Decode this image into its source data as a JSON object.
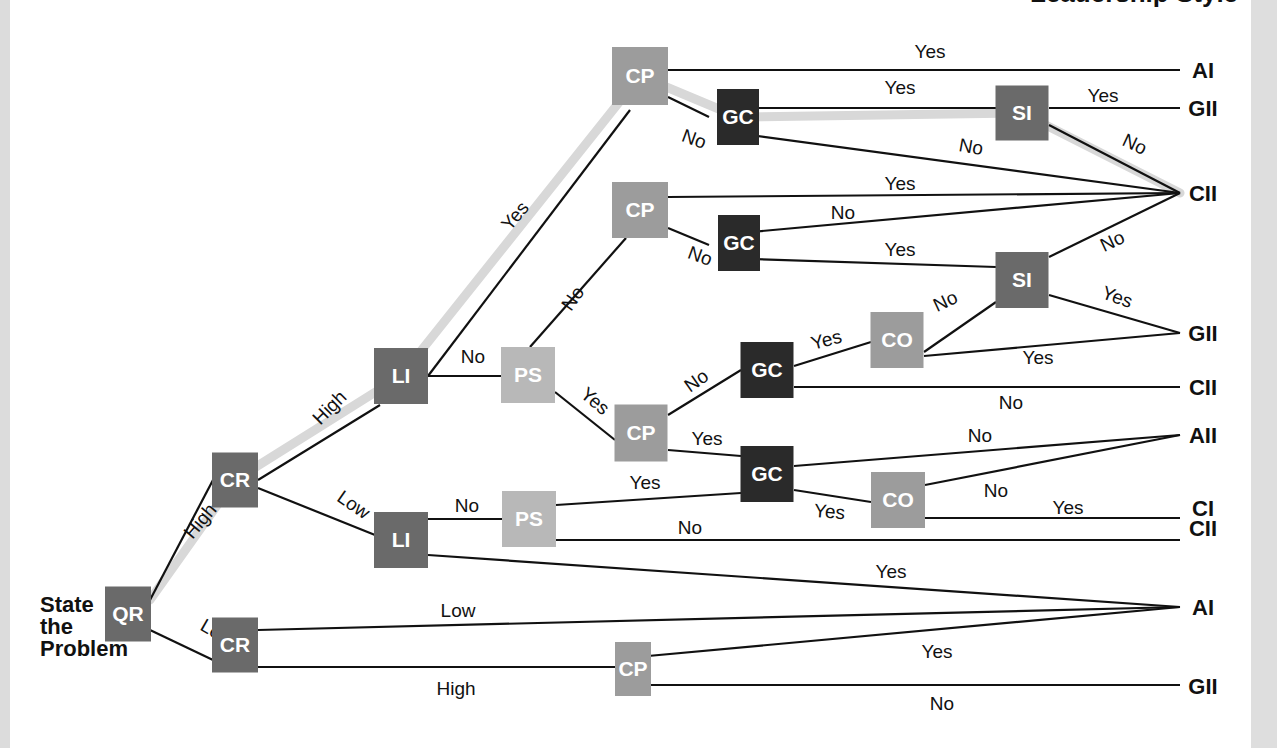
{
  "title_fragment": "Leadership Style",
  "start": {
    "lines": [
      "State",
      "the",
      "Problem"
    ]
  },
  "colors": {
    "QR": "#6a6a6a",
    "CR": "#6a6a6a",
    "LI": "#6a6a6a",
    "PS": "#b8b8b8",
    "CP": "#9c9c9c",
    "GC": "#2a2a2a",
    "SI": "#6a6a6a",
    "CO": "#9c9c9c",
    "highlight": "#d8d8d8",
    "line": "#111111"
  },
  "nodes": [
    {
      "id": "qr",
      "label": "QR",
      "type": "QR",
      "x": 128,
      "y": 614,
      "w": 46,
      "h": 55
    },
    {
      "id": "cr_high",
      "label": "CR",
      "type": "CR",
      "x": 235,
      "y": 480,
      "w": 46,
      "h": 55
    },
    {
      "id": "cr_low",
      "label": "CR",
      "type": "CR",
      "x": 235,
      "y": 645,
      "w": 46,
      "h": 55
    },
    {
      "id": "li_high",
      "label": "LI",
      "type": "LI",
      "x": 401,
      "y": 376,
      "w": 54,
      "h": 56
    },
    {
      "id": "li_low",
      "label": "LI",
      "type": "LI",
      "x": 401,
      "y": 540,
      "w": 54,
      "h": 56
    },
    {
      "id": "ps_top",
      "label": "PS",
      "type": "PS",
      "x": 528,
      "y": 375,
      "w": 54,
      "h": 56
    },
    {
      "id": "ps_low",
      "label": "PS",
      "type": "PS",
      "x": 529,
      "y": 519,
      "w": 54,
      "h": 56
    },
    {
      "id": "cp1",
      "label": "CP",
      "type": "CP",
      "x": 640,
      "y": 76,
      "w": 56,
      "h": 58
    },
    {
      "id": "cp2",
      "label": "CP",
      "type": "CP",
      "x": 640,
      "y": 210,
      "w": 56,
      "h": 56
    },
    {
      "id": "cp3",
      "label": "CP",
      "type": "CP",
      "x": 641,
      "y": 433,
      "w": 53,
      "h": 57
    },
    {
      "id": "cp4",
      "label": "CP",
      "type": "CP",
      "x": 633,
      "y": 669,
      "w": 36,
      "h": 54
    },
    {
      "id": "gc1",
      "label": "GC",
      "type": "GC",
      "x": 738,
      "y": 117,
      "w": 42,
      "h": 56
    },
    {
      "id": "gc2",
      "label": "GC",
      "type": "GC",
      "x": 739,
      "y": 243,
      "w": 42,
      "h": 56
    },
    {
      "id": "gc3",
      "label": "GC",
      "type": "GC",
      "x": 767,
      "y": 370,
      "w": 53,
      "h": 56
    },
    {
      "id": "gc4",
      "label": "GC",
      "type": "GC",
      "x": 767,
      "y": 474,
      "w": 53,
      "h": 56
    },
    {
      "id": "si1",
      "label": "SI",
      "type": "SI",
      "x": 1022,
      "y": 113,
      "w": 53,
      "h": 55
    },
    {
      "id": "si2",
      "label": "SI",
      "type": "SI",
      "x": 1022,
      "y": 280,
      "w": 53,
      "h": 56
    },
    {
      "id": "co1",
      "label": "CO",
      "type": "CO",
      "x": 897,
      "y": 340,
      "w": 53,
      "h": 56
    },
    {
      "id": "co2",
      "label": "CO",
      "type": "CO",
      "x": 898,
      "y": 500,
      "w": 54,
      "h": 56
    }
  ],
  "outcomes": [
    {
      "id": "o_ai_1",
      "label": "AI",
      "x": 1203,
      "y": 70
    },
    {
      "id": "o_gii_1",
      "label": "GII",
      "x": 1203,
      "y": 108
    },
    {
      "id": "o_cii_1",
      "label": "CII",
      "x": 1203,
      "y": 193
    },
    {
      "id": "o_gii_2",
      "label": "GII",
      "x": 1203,
      "y": 333
    },
    {
      "id": "o_cii_2",
      "label": "CII",
      "x": 1203,
      "y": 387
    },
    {
      "id": "o_aii",
      "label": "AII",
      "x": 1203,
      "y": 435
    },
    {
      "id": "o_ci",
      "label": "CI",
      "x": 1203,
      "y": 508
    },
    {
      "id": "o_cii_3",
      "label": "CII",
      "x": 1203,
      "y": 528
    },
    {
      "id": "o_ai_2",
      "label": "AI",
      "x": 1203,
      "y": 607
    },
    {
      "id": "o_gii_3",
      "label": "GII",
      "x": 1203,
      "y": 686
    }
  ],
  "highlight_path": [
    [
      150,
      600
    ],
    [
      235,
      480
    ],
    [
      401,
      376
    ],
    [
      640,
      76
    ],
    [
      738,
      117
    ],
    [
      1022,
      113
    ],
    [
      1180,
      193
    ]
  ],
  "edges": [
    {
      "from": [
        150,
        600
      ],
      "to": [
        213,
        480
      ],
      "label": "High",
      "lx": 205,
      "ly": 525,
      "rot": -50
    },
    {
      "from": [
        150,
        630
      ],
      "to": [
        213,
        660
      ],
      "label": "Low",
      "lx": 214,
      "ly": 638,
      "rot": 30
    },
    {
      "from": [
        258,
        480
      ],
      "to": [
        380,
        405
      ],
      "label": "High",
      "lx": 334,
      "ly": 412,
      "rot": -45
    },
    {
      "from": [
        258,
        488
      ],
      "to": [
        375,
        535
      ],
      "label": "Low",
      "lx": 350,
      "ly": 510,
      "rot": 35
    },
    {
      "from": [
        428,
        376
      ],
      "to": [
        630,
        110
      ],
      "label": "Yes",
      "lx": 520,
      "ly": 220,
      "rot": -50
    },
    {
      "from": [
        428,
        376
      ],
      "to": [
        502,
        376
      ],
      "label": "No",
      "lx": 473,
      "ly": 363,
      "rot": 0
    },
    {
      "from": [
        530,
        347
      ],
      "to": [
        626,
        238
      ],
      "label": "No",
      "lx": 578,
      "ly": 302,
      "rot": -55
    },
    {
      "from": [
        555,
        392
      ],
      "to": [
        615,
        440
      ],
      "label": "Yes",
      "lx": 591,
      "ly": 406,
      "rot": 40
    },
    {
      "from": [
        668,
        70
      ],
      "to": [
        1180,
        70
      ],
      "label": "Yes",
      "lx": 930,
      "ly": 58,
      "rot": 0
    },
    {
      "from": [
        668,
        97
      ],
      "to": [
        709,
        117
      ],
      "label": "No",
      "lx": 692,
      "ly": 145,
      "rot": 20
    },
    {
      "from": [
        750,
        108
      ],
      "to": [
        996,
        108
      ],
      "label": "Yes",
      "lx": 900,
      "ly": 94,
      "rot": 0
    },
    {
      "from": [
        750,
        135
      ],
      "to": [
        1180,
        193
      ],
      "label": "No",
      "lx": 970,
      "ly": 153,
      "rot": 10
    },
    {
      "from": [
        1049,
        108
      ],
      "to": [
        1180,
        108
      ],
      "label": "Yes",
      "lx": 1103,
      "ly": 102,
      "rot": 0
    },
    {
      "from": [
        1049,
        125
      ],
      "to": [
        1180,
        193
      ],
      "label": "No",
      "lx": 1132,
      "ly": 150,
      "rot": 25
    },
    {
      "from": [
        668,
        197
      ],
      "to": [
        1180,
        193
      ],
      "label": "Yes",
      "lx": 900,
      "ly": 190,
      "rot": 0
    },
    {
      "from": [
        668,
        228
      ],
      "to": [
        709,
        245
      ],
      "label": "No",
      "lx": 698,
      "ly": 262,
      "rot": 20
    },
    {
      "from": [
        751,
        232
      ],
      "to": [
        1180,
        193
      ],
      "label": "No",
      "lx": 843,
      "ly": 219,
      "rot": 0
    },
    {
      "from": [
        751,
        259
      ],
      "to": [
        996,
        267
      ],
      "label": "Yes",
      "lx": 900,
      "ly": 256,
      "rot": 0
    },
    {
      "from": [
        1049,
        257
      ],
      "to": [
        1180,
        193
      ],
      "label": "No",
      "lx": 1115,
      "ly": 247,
      "rot": -25
    },
    {
      "from": [
        1049,
        295
      ],
      "to": [
        1180,
        333
      ],
      "label": "Yes",
      "lx": 1115,
      "ly": 303,
      "rot": 20
    },
    {
      "from": [
        924,
        352
      ],
      "to": [
        996,
        302
      ],
      "label": "No",
      "lx": 948,
      "ly": 307,
      "rot": -25
    },
    {
      "from": [
        924,
        356
      ],
      "to": [
        1180,
        333
      ],
      "label": "Yes",
      "lx": 1038,
      "ly": 364,
      "rot": 0
    },
    {
      "from": [
        668,
        415
      ],
      "to": [
        741,
        370
      ],
      "label": "No",
      "lx": 700,
      "ly": 386,
      "rot": -35
    },
    {
      "from": [
        668,
        450
      ],
      "to": [
        741,
        456
      ],
      "label": "Yes",
      "lx": 707,
      "ly": 445,
      "rot": 0
    },
    {
      "from": [
        794,
        366
      ],
      "to": [
        871,
        342
      ],
      "label": "Yes",
      "lx": 828,
      "ly": 346,
      "rot": -15
    },
    {
      "from": [
        794,
        387
      ],
      "to": [
        1180,
        387
      ],
      "label": "No",
      "lx": 1011,
      "ly": 409,
      "rot": 0
    },
    {
      "from": [
        794,
        466
      ],
      "to": [
        1180,
        435
      ],
      "label": "No",
      "lx": 980,
      "ly": 442,
      "rot": 0
    },
    {
      "from": [
        794,
        490
      ],
      "to": [
        871,
        502
      ],
      "label": "Yes",
      "lx": 829,
      "ly": 518,
      "rot": 5
    },
    {
      "from": [
        925,
        485
      ],
      "to": [
        1180,
        435
      ],
      "label": "No",
      "lx": 996,
      "ly": 497,
      "rot": 0
    },
    {
      "from": [
        925,
        518
      ],
      "to": [
        1180,
        518
      ],
      "label": "Yes",
      "lx": 1068,
      "ly": 514,
      "rot": 0
    },
    {
      "from": [
        428,
        519
      ],
      "to": [
        502,
        519
      ],
      "label": "No",
      "lx": 467,
      "ly": 512,
      "rot": 0
    },
    {
      "from": [
        556,
        505
      ],
      "to": [
        741,
        493
      ],
      "label": "Yes",
      "lx": 645,
      "ly": 489,
      "rot": 0
    },
    {
      "from": [
        556,
        540
      ],
      "to": [
        1180,
        540
      ],
      "label": "No",
      "lx": 690,
      "ly": 534,
      "rot": 0
    },
    {
      "from": [
        428,
        555
      ],
      "to": [
        1180,
        607
      ],
      "label": "Yes",
      "lx": 891,
      "ly": 578,
      "rot": 0
    },
    {
      "from": [
        258,
        630
      ],
      "to": [
        1180,
        607
      ],
      "label": "Low",
      "lx": 458,
      "ly": 617,
      "rot": 0
    },
    {
      "from": [
        258,
        667
      ],
      "to": [
        615,
        667
      ],
      "label": "High",
      "lx": 456,
      "ly": 695,
      "rot": 0
    },
    {
      "from": [
        648,
        656
      ],
      "to": [
        1180,
        607
      ],
      "label": "Yes",
      "lx": 937,
      "ly": 658,
      "rot": 0
    },
    {
      "from": [
        648,
        685
      ],
      "to": [
        1180,
        685
      ],
      "label": "No",
      "lx": 942,
      "ly": 710,
      "rot": 0
    }
  ]
}
